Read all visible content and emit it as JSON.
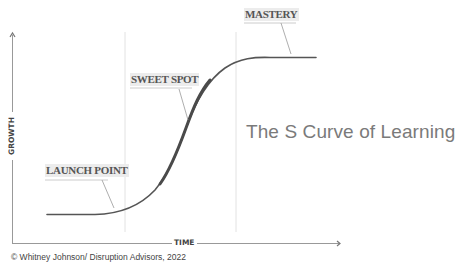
{
  "diagram": {
    "title": "The S Curve of Learning",
    "axes": {
      "x_label": "TIME",
      "y_label": "GROWTH"
    },
    "labels": {
      "launch_point": "LAUNCH POINT",
      "sweet_spot": "SWEET SPOT",
      "mastery": "MASTERY"
    },
    "phases": [
      "LAUNCH POINT",
      "SWEET SPOT",
      "MASTERY"
    ],
    "copyright": "© Whitney Johnson/ Disruption Advisors, 2022",
    "colors": {
      "curve": "#555555",
      "axis": "#888888",
      "divider": "#dddddd",
      "title": "#7a7a7a",
      "label_bg": "#ececec"
    }
  }
}
